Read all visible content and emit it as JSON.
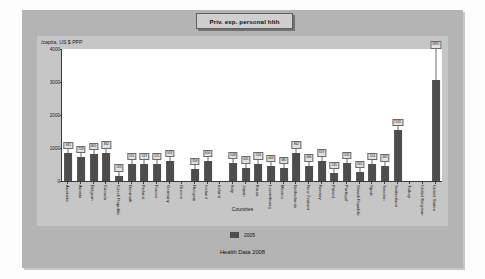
{
  "title": "Priv. exp. personal hlth",
  "caption": "Health Data 2008",
  "legend": {
    "label": "2005"
  },
  "colors": {
    "bar": "#4d4d4d",
    "panel": "#b4b4b4",
    "card": "#c6c6c6",
    "plot": "#ffffff",
    "axis": "#3a3a3a"
  },
  "chart_data": {
    "type": "bar",
    "title": "Priv. exp. personal hlth",
    "xlabel": "Countries",
    "ylabel": "/capita, US $ PPP",
    "ylim": [
      0,
      4000
    ],
    "yticks": [
      0,
      1000,
      2000,
      3000,
      4000
    ],
    "grid": false,
    "legend_position": "bottom",
    "series_name": "2005",
    "categories": [
      "Australia",
      "Austria",
      "Belgium",
      "Canada",
      "Czech Republic",
      "Denmark",
      "Finland",
      "France",
      "Germany",
      "Greece",
      "Hungary",
      "Iceland",
      "Ireland",
      "Italy",
      "Japan",
      "Korea",
      "Luxembourg",
      "Mexico",
      "Netherlands",
      "New Zealand",
      "Norway",
      "Poland",
      "Portugal",
      "Slovak Republic",
      "Spain",
      "Sweden",
      "Switzerland",
      "Turkey",
      "United Kingdom",
      "United States"
    ],
    "values": [
      841,
      728,
      805,
      862,
      163,
      515,
      519,
      521,
      593,
      null,
      358,
      604,
      null,
      548,
      405,
      526,
      444,
      380,
      862,
      466,
      619,
      245,
      535,
      265,
      514,
      465,
      1535,
      null,
      null,
      3060
    ],
    "error_high": [
      841,
      728,
      805,
      862,
      163,
      515,
      519,
      521,
      593,
      null,
      358,
      604,
      null,
      548,
      405,
      526,
      444,
      380,
      862,
      466,
      619,
      245,
      535,
      265,
      514,
      465,
      1535,
      null,
      null,
      3890
    ],
    "labels": [
      "841",
      "728",
      "805",
      "862",
      "163",
      "515",
      "519",
      "521",
      "593",
      "",
      "358",
      "604",
      "",
      "548",
      "405",
      "526",
      "444",
      "380",
      "862",
      "466",
      "619",
      "245",
      "535",
      "265",
      "514",
      "465",
      "1535",
      "",
      "",
      "3890"
    ]
  }
}
